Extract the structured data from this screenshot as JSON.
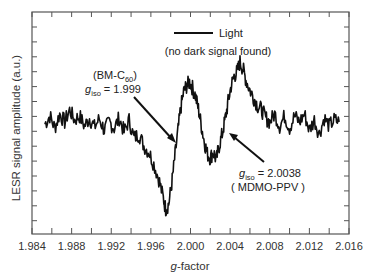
{
  "chart_data": {
    "type": "line",
    "title": "",
    "xlabel": "g-factor",
    "xlabel_italic_part": "g",
    "xlabel_rest": "-factor",
    "ylabel": "LESR signal amplitude (a.u.)",
    "xlim": [
      1.984,
      2.016
    ],
    "ylim": [
      -110,
      112
    ],
    "grid": false,
    "x_tick_labels": [
      "1.984",
      "1.988",
      "1.992",
      "1.996",
      "2.000",
      "2.004",
      "2.008",
      "2.012",
      "2.016"
    ],
    "x_ticks_major": [
      1.984,
      1.988,
      1.992,
      1.996,
      2.0,
      2.004,
      2.008,
      2.012,
      2.016
    ],
    "x_ticks_minor": [
      1.986,
      1.99,
      1.994,
      1.998,
      2.002,
      2.006,
      2.01,
      2.014
    ],
    "y_tick_labels": [],
    "legend": {
      "position": "top-center",
      "entries": [
        {
          "label": "Light",
          "style": "solid-black-line"
        }
      ],
      "note": "(no dark signal found)"
    },
    "annotations": [
      {
        "line1": "(BM-C60)",
        "line1_main": "(BM-C",
        "line1_sub": "60",
        "line1_end": ")",
        "line2_var": "g",
        "line2_sub": "iso",
        "line2_value": " = 1.999",
        "arrow_to_g": 1.999
      },
      {
        "line1_var": "g",
        "line1_sub": "iso",
        "line1_value": " = 2.0038",
        "line2": "( MDMO-PPV )",
        "arrow_to_g": 2.004
      }
    ],
    "series": [
      {
        "name": "Light",
        "color": "#111111",
        "x": [
          1.9853,
          1.9858,
          1.9863,
          1.9868,
          1.9873,
          1.9878,
          1.9883,
          1.9888,
          1.9893,
          1.9898,
          1.9903,
          1.9908,
          1.9913,
          1.9918,
          1.9923,
          1.9928,
          1.9933,
          1.9938,
          1.9943,
          1.9948,
          1.9953,
          1.9958,
          1.9963,
          1.9968,
          1.9972,
          1.9975,
          1.9978,
          1.9981,
          1.9984,
          1.9987,
          1.999,
          1.9993,
          1.9996,
          1.9999,
          2.0002,
          2.0005,
          2.0008,
          2.0011,
          2.0014,
          2.0017,
          2.002,
          2.0023,
          2.0026,
          2.0029,
          2.0032,
          2.0035,
          2.0038,
          2.0041,
          2.0044,
          2.0047,
          2.005,
          2.0053,
          2.0056,
          2.006,
          2.0064,
          2.0068,
          2.0072,
          2.0076,
          2.008,
          2.0085,
          2.009,
          2.0095,
          2.01,
          2.0105,
          2.011,
          2.0115,
          2.012,
          2.0125,
          2.013,
          2.0135,
          2.014,
          2.0145,
          2.015
        ],
        "y": [
          0,
          8,
          -4,
          10,
          2,
          14,
          4,
          8,
          -2,
          6,
          -3,
          5,
          -6,
          2,
          -4,
          6,
          -8,
          4,
          -14,
          -10,
          -22,
          -28,
          -40,
          -55,
          -72,
          -85,
          -80,
          -60,
          -35,
          -10,
          15,
          32,
          38,
          42,
          36,
          28,
          15,
          -2,
          -18,
          -30,
          -34,
          -28,
          -36,
          -22,
          -10,
          5,
          22,
          38,
          48,
          52,
          62,
          55,
          44,
          34,
          26,
          18,
          14,
          6,
          2,
          10,
          -2,
          8,
          -4,
          8,
          2,
          10,
          -6,
          4,
          -10,
          6,
          -2,
          4,
          2
        ]
      }
    ]
  }
}
